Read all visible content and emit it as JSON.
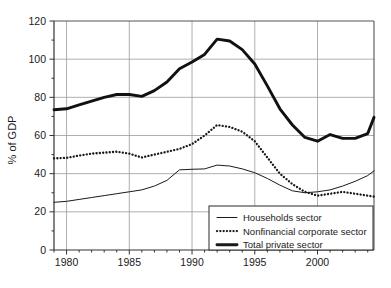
{
  "chart_data": {
    "type": "line",
    "title": "",
    "subtitle": "",
    "xlabel": "",
    "ylabel": "% of GDP",
    "xlim": [
      1979,
      2004.5
    ],
    "ylim": [
      0,
      120
    ],
    "grid": true,
    "grid_x_values": [
      1980,
      1985,
      1990,
      1995,
      2000
    ],
    "grid_y_values": [
      0,
      20,
      40,
      60,
      80,
      100,
      120
    ],
    "x_tick_labels": [
      "1980",
      "1985",
      "1990",
      "1995",
      "2000"
    ],
    "x_tick_values": [
      1980,
      1985,
      1990,
      1995,
      2000
    ],
    "x_minor_tick_step": 1,
    "y_tick_labels": [
      "0",
      "20",
      "40",
      "60",
      "80",
      "100",
      "120"
    ],
    "y_tick_values": [
      0,
      20,
      40,
      60,
      80,
      100,
      120
    ],
    "y_minor_tick_step": 10,
    "legend_position": "bottom-right",
    "x": [
      1979,
      1980,
      1981,
      1982,
      1983,
      1984,
      1985,
      1986,
      1987,
      1988,
      1989,
      1990,
      1991,
      1992,
      1993,
      1994,
      1995,
      1996,
      1997,
      1998,
      1999,
      2000,
      2001,
      2002,
      2003,
      2004,
      2004.5
    ],
    "series": [
      {
        "name": "Households sector",
        "style": "thin-solid",
        "color": "#1a1a1a",
        "values": [
          25.0,
          25.5,
          26.5,
          27.5,
          28.5,
          29.5,
          30.5,
          31.5,
          33.5,
          36.5,
          42.0,
          42.3,
          42.5,
          44.5,
          44.0,
          42.5,
          40.5,
          37.5,
          34.0,
          31.0,
          30.0,
          30.5,
          31.5,
          33.5,
          36.0,
          39.0,
          41.5
        ]
      },
      {
        "name": "Nonfinancial corporate sector",
        "style": "dotted",
        "color": "#1a1a1a",
        "values": [
          48.0,
          48.3,
          49.5,
          50.5,
          51.0,
          51.5,
          50.5,
          48.5,
          50.0,
          51.5,
          53.0,
          55.5,
          60.0,
          65.5,
          64.5,
          62.0,
          57.0,
          48.5,
          40.0,
          34.5,
          30.5,
          28.5,
          29.5,
          30.5,
          29.5,
          28.5,
          28.0
        ]
      },
      {
        "name": "Total private sector",
        "style": "thick-solid",
        "color": "#111111",
        "values": [
          73.5,
          74.0,
          76.0,
          78.0,
          80.0,
          81.5,
          81.5,
          80.5,
          83.5,
          88.0,
          95.0,
          98.5,
          102.5,
          110.5,
          109.5,
          105.0,
          97.5,
          86.0,
          74.0,
          65.5,
          59.0,
          57.0,
          60.5,
          58.5,
          58.5,
          61.0,
          69.5
        ]
      }
    ]
  },
  "legend": {
    "items": [
      {
        "label": "Households sector",
        "style": "thin-solid"
      },
      {
        "label": "Nonfinancial corporate sector",
        "style": "dotted"
      },
      {
        "label": "Total private sector",
        "style": "thick-solid"
      }
    ]
  },
  "axes": {
    "y_title": "% of GDP"
  },
  "colors": {
    "line": "#1a1a1a",
    "grid": "#9a9a9a",
    "axis": "#555555",
    "legend_border": "#2b2b2b",
    "background": "#ffffff"
  }
}
